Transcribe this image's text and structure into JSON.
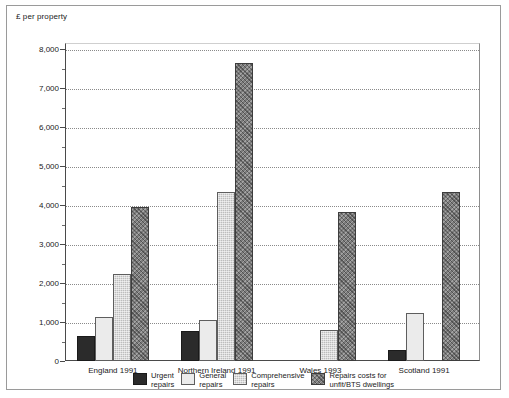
{
  "chart_data": {
    "type": "bar",
    "title": "",
    "ylabel": "£ per property",
    "xlabel": "",
    "ylim": [
      0,
      8000
    ],
    "ytick_labels": [
      "0",
      "1,000",
      "2,000",
      "3,000",
      "4,000",
      "5,000",
      "6,000",
      "7,000",
      "8,000"
    ],
    "ytick_values": [
      0,
      1000,
      2000,
      3000,
      4000,
      5000,
      6000,
      7000,
      8000
    ],
    "yminor_step": 500,
    "grid": "horizontal-dotted",
    "legend_position": "bottom",
    "categories": [
      "England 1991",
      "Northern Ireland 1991",
      "Wales 1993",
      "Scotland 1991"
    ],
    "series": [
      {
        "name": "Urgent repairs",
        "legend_label": "Urgent\nrepairs",
        "color": "#2b2b2b",
        "pattern": "solid-dark",
        "values": [
          640,
          760,
          null,
          280
        ]
      },
      {
        "name": "General repairs",
        "legend_label": "General\nrepairs",
        "color": "#ebebeb",
        "pattern": "light-solid",
        "values": [
          1140,
          1060,
          null,
          1230
        ]
      },
      {
        "name": "Comprehensive repairs",
        "legend_label": "Comprehensive\nrepairs",
        "color": "#bdbdbd",
        "pattern": "medium-grey-stipple",
        "values": [
          2230,
          4330,
          800,
          null
        ]
      },
      {
        "name": "Repairs costs for unfit/BTS dwellings",
        "legend_label": "Repairs costs for\nunfit/BTS dwellings",
        "color": "#7c7c7c",
        "pattern": "dark-crosshatch",
        "values": [
          3950,
          7640,
          3810,
          4330
        ]
      }
    ]
  }
}
